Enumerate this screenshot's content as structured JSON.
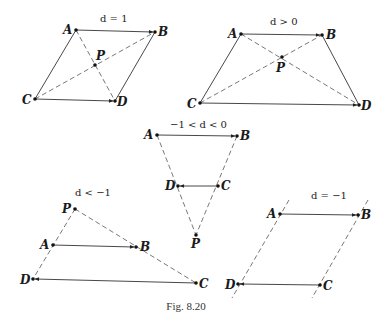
{
  "figure": {
    "caption": "Fig. 8.20",
    "colors": {
      "ink": "#222222",
      "background": "#ffffff"
    }
  },
  "panels": [
    {
      "condition": "d = 1",
      "points": {
        "A": [
          76,
          30
        ],
        "B": [
          155,
          32
        ],
        "P": [
          95,
          65
        ],
        "C": [
          35,
          99
        ],
        "D": [
          115,
          101
        ]
      },
      "labels": {
        "A": "A",
        "B": "B",
        "P": "P",
        "C": "C",
        "D": "D"
      }
    },
    {
      "condition": "d > 0",
      "points": {
        "A": [
          241,
          34
        ],
        "B": [
          322,
          35
        ],
        "P": [
          282,
          57
        ],
        "C": [
          200,
          103
        ],
        "D": [
          359,
          105
        ]
      },
      "labels": {
        "A": "A",
        "B": "B",
        "P": "P",
        "C": "C",
        "D": "D"
      }
    },
    {
      "condition": "−1 < d < 0",
      "points": {
        "A": [
          157,
          135
        ],
        "B": [
          237,
          136
        ],
        "D": [
          178,
          186
        ],
        "C": [
          218,
          186
        ],
        "P": [
          196,
          235
        ]
      },
      "labels": {
        "A": "A",
        "B": "B",
        "P": "P",
        "C": "C",
        "D": "D"
      }
    },
    {
      "condition": "d < −1",
      "points": {
        "P": [
          75,
          209
        ],
        "A": [
          53,
          245
        ],
        "B": [
          136,
          247
        ],
        "D": [
          33,
          279
        ],
        "C": [
          196,
          283
        ]
      },
      "labels": {
        "A": "A",
        "B": "B",
        "P": "P",
        "C": "C",
        "D": "D"
      }
    },
    {
      "condition": "d = −1",
      "points": {
        "A": [
          280,
          214
        ],
        "B": [
          358,
          215
        ],
        "D": [
          238,
          284
        ],
        "C": [
          320,
          285
        ]
      },
      "labels": {
        "A": "A",
        "B": "B",
        "C": "C",
        "D": "D"
      }
    }
  ]
}
